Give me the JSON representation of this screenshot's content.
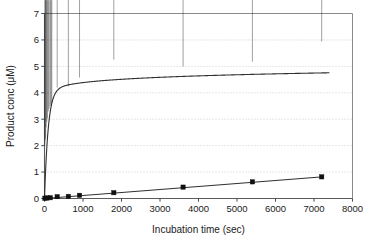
{
  "chart_data": {
    "type": "scatter",
    "title": "",
    "xlabel": "Incubation time (sec)",
    "ylabel": "Product conc (μM)",
    "xlim": [
      0,
      8000
    ],
    "ylim": [
      0,
      7
    ],
    "xticks": [
      0,
      1000,
      2000,
      3000,
      4000,
      5000,
      6000,
      7000,
      8000
    ],
    "yticks": [
      0,
      1,
      2,
      3,
      4,
      5,
      6,
      7
    ],
    "xtick_labels": [
      "0",
      "1000",
      "2000",
      "3000",
      "4000",
      "5000",
      "6000",
      "7000",
      "8000"
    ],
    "ytick_labels": [
      "0",
      "1",
      "2",
      "3",
      "4",
      "5",
      "6",
      "7"
    ],
    "grid": "horizontal-dotted",
    "legend": "none",
    "series": [
      {
        "name": "fast-product",
        "marker": "diamond",
        "color": "#111111",
        "fit": "saturating",
        "points": [
          {
            "x": 10,
            "y": 1.9
          },
          {
            "x": 20,
            "y": 2.08
          },
          {
            "x": 30,
            "y": 2.18
          },
          {
            "x": 45,
            "y": 2.58
          },
          {
            "x": 60,
            "y": 2.78
          },
          {
            "x": 75,
            "y": 2.92
          },
          {
            "x": 100,
            "y": 3.18
          },
          {
            "x": 120,
            "y": 3.28
          },
          {
            "x": 150,
            "y": 3.38
          },
          {
            "x": 170,
            "y": 3.45
          },
          {
            "x": 190,
            "y": 3.52
          },
          {
            "x": 330,
            "y": 4.08
          },
          {
            "x": 620,
            "y": 4.13
          },
          {
            "x": 910,
            "y": 4.46
          },
          {
            "x": 1800,
            "y": 5.14
          },
          {
            "x": 3600,
            "y": 4.88
          },
          {
            "x": 5400,
            "y": 5.06
          },
          {
            "x": 7200,
            "y": 5.82
          }
        ]
      },
      {
        "name": "slow-product",
        "marker": "square",
        "color": "#111111",
        "fit": "linear",
        "points": [
          {
            "x": 10,
            "y": 0.01
          },
          {
            "x": 60,
            "y": 0.02
          },
          {
            "x": 150,
            "y": 0.03
          },
          {
            "x": 330,
            "y": 0.07
          },
          {
            "x": 620,
            "y": 0.08
          },
          {
            "x": 910,
            "y": 0.12
          },
          {
            "x": 1800,
            "y": 0.22
          },
          {
            "x": 3600,
            "y": 0.43
          },
          {
            "x": 5400,
            "y": 0.63
          },
          {
            "x": 7200,
            "y": 0.82
          }
        ]
      }
    ]
  }
}
